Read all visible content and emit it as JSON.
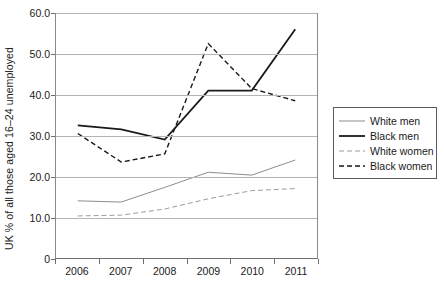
{
  "chart_data": {
    "type": "line",
    "title": "",
    "xlabel": "",
    "ylabel": "UK % of all those aged 16–24 unemployed",
    "categories": [
      "2006",
      "2007",
      "2008",
      "2009",
      "2010",
      "2011"
    ],
    "ylim": [
      0,
      60
    ],
    "yticks": [
      "0",
      "10.0",
      "20.0",
      "30.0",
      "40.0",
      "50.0",
      "60.0"
    ],
    "ytick_values": [
      0,
      10,
      20,
      30,
      40,
      50,
      60
    ],
    "grid": "horizontal",
    "legend_position": "right",
    "series": [
      {
        "name": "White men",
        "values": [
          14.0,
          13.7,
          17.3,
          21.0,
          20.3,
          24.0
        ],
        "color": "#8c8c8c",
        "style": "solid",
        "width": 1.0
      },
      {
        "name": "Black men",
        "values": [
          32.5,
          31.5,
          29.0,
          41.0,
          41.0,
          56.0
        ],
        "color": "#1a1a1a",
        "style": "solid",
        "width": 1.8
      },
      {
        "name": "White women",
        "values": [
          10.3,
          10.5,
          12.0,
          14.5,
          16.5,
          17.0
        ],
        "color": "#9a9a9a",
        "style": "dashed",
        "width": 1.0
      },
      {
        "name": "Black women",
        "values": [
          30.5,
          23.5,
          25.5,
          52.5,
          41.5,
          38.5
        ],
        "color": "#1a1a1a",
        "style": "dashed",
        "width": 1.4
      }
    ]
  },
  "legend": {
    "items": [
      {
        "label": "White men"
      },
      {
        "label": "Black men"
      },
      {
        "label": "White women"
      },
      {
        "label": "Black women"
      }
    ]
  }
}
